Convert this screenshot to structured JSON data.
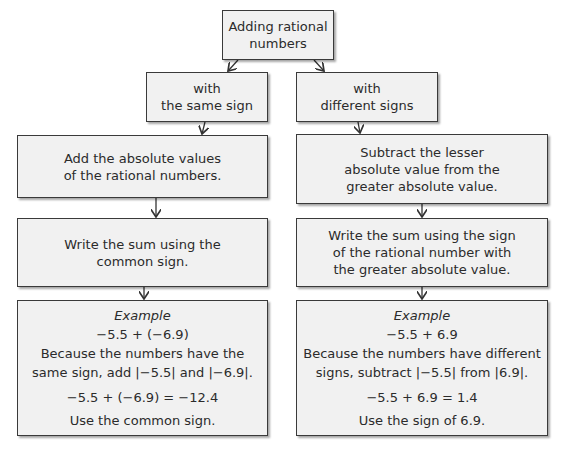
{
  "root": {
    "lines": [
      "Adding rational",
      "numbers"
    ]
  },
  "left": {
    "branch": {
      "lines": [
        "with",
        "the same sign"
      ]
    },
    "step1": {
      "lines": [
        "Add the absolute values",
        "of the rational numbers."
      ]
    },
    "step2": {
      "lines": [
        "Write the sum using the",
        "common sign."
      ]
    },
    "example": {
      "title": "Example",
      "expression": "−5.5 + (−6.9)",
      "explain1": "Because the numbers have the",
      "explain2": "same sign, add |−5.5| and |−6.9|.",
      "result": "−5.5 + (−6.9) = −12.4",
      "note": "Use the common sign."
    }
  },
  "right": {
    "branch": {
      "lines": [
        "with",
        "different signs"
      ]
    },
    "step1": {
      "lines": [
        "Subtract the lesser",
        "absolute value from the",
        "greater absolute value."
      ]
    },
    "step2": {
      "lines": [
        "Write the sum using the sign",
        "of the rational number with",
        "the greater absolute value."
      ]
    },
    "example": {
      "title": "Example",
      "expression": "−5.5 + 6.9",
      "explain1": "Because the numbers have different",
      "explain2": "signs, subtract |−5.5| from |6.9|.",
      "result": "−5.5 + 6.9 = 1.4",
      "note": "Use the sign of 6.9."
    }
  }
}
